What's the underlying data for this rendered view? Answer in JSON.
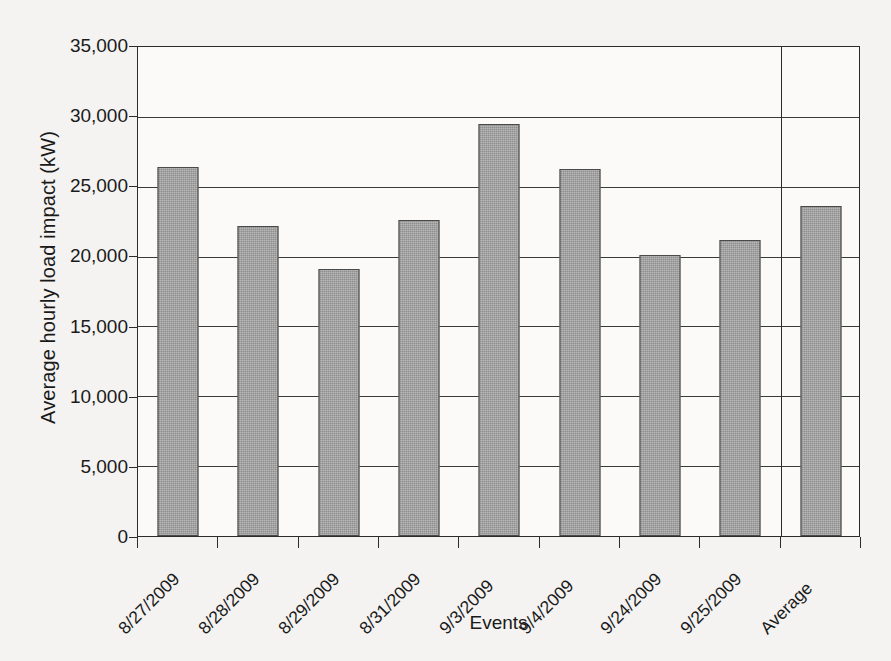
{
  "chart_data": {
    "type": "bar",
    "title": "",
    "xlabel": "Events",
    "ylabel": "Average hourly load impact (kW)",
    "categories": [
      "8/27/2009",
      "8/28/2009",
      "8/29/2009",
      "8/31/2009",
      "9/3/2009",
      "9/4/2009",
      "9/24/2009",
      "9/25/2009",
      "Average"
    ],
    "values": [
      26400,
      22200,
      19100,
      22600,
      29500,
      26300,
      20100,
      21200,
      23600
    ],
    "ylim": [
      0,
      35000
    ],
    "ytick_labels": [
      "35,000",
      "30,000",
      "25,000",
      "20,000",
      "15,000",
      "10,000",
      "5,000",
      "0"
    ],
    "ytick_values": [
      35000,
      30000,
      25000,
      20000,
      15000,
      10000,
      5000,
      0
    ],
    "ytick_step": 5000,
    "grid": "horizontal",
    "legend": "none",
    "bar_color": "#8e8e8e",
    "bar_border_color": "#4a4a4a",
    "axis_color": "#2b2b2b",
    "background_color": "#f4f3f1",
    "plot_background_color": "#fbfaf8",
    "annotations": [
      {
        "name": "average-separator",
        "description": "Vertical divider separating the event bars from the Average bar",
        "after_category": "9/25/2009"
      }
    ]
  }
}
